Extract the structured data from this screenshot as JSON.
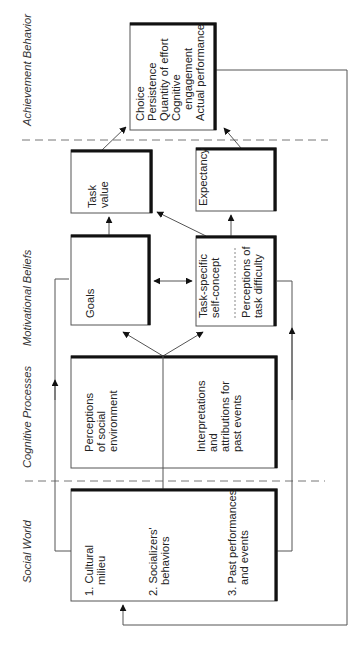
{
  "diagram": {
    "orientation": "rotated 90 degrees counter-clockwise",
    "stages": [
      {
        "id": "social_world",
        "label": "Social World"
      },
      {
        "id": "cognitive_processes",
        "label": "Cognitive Processes"
      },
      {
        "id": "motivational_beliefs",
        "label": "Motivational Beliefs"
      },
      {
        "id": "achievement_behavior",
        "label": "Achievement Behavior"
      }
    ],
    "boxes": {
      "achievement": {
        "lines": [
          "Choice",
          "Persistence",
          "Quantity of effort",
          "Cognitive",
          "engagement",
          "Actual performance"
        ]
      },
      "task_value": {
        "lines": [
          "Task",
          "value"
        ]
      },
      "expectancy": {
        "lines": [
          "Expectancy"
        ]
      },
      "goals": {
        "lines": [
          "Goals"
        ]
      },
      "self_concept": {
        "upper_lines": [
          "Task-specific",
          "self-concept"
        ],
        "lower_lines": [
          "Perceptions of",
          "task difficulty"
        ]
      },
      "cognitive": {
        "left_lines": [
          "Perceptions",
          "of social",
          "environment"
        ],
        "right_lines": [
          "Interpretations",
          "and",
          "attributions for",
          "past events"
        ]
      },
      "social": {
        "items": [
          {
            "lines": [
              "1. Cultural",
              "milieu"
            ]
          },
          {
            "lines": [
              "2. Socializers'",
              "behaviors"
            ]
          },
          {
            "lines": [
              "3. Past performances",
              "and events"
            ]
          }
        ]
      }
    },
    "connections": [
      {
        "from": "Task value",
        "to": "Achievement Behavior"
      },
      {
        "from": "Expectancy",
        "to": "Achievement Behavior"
      },
      {
        "from": "Goals",
        "to": "Task value"
      },
      {
        "from": "Task-specific self-concept",
        "to": "Task value"
      },
      {
        "from": "Task-specific self-concept",
        "to": "Expectancy"
      },
      {
        "from": "Goals",
        "to": "Task-specific self-concept",
        "bidirectional": true
      },
      {
        "from": "Cognitive Processes",
        "to": "Goals"
      },
      {
        "from": "Cognitive Processes",
        "to": "Task-specific self-concept"
      },
      {
        "from": "Social World",
        "to": "Cognitive Processes"
      },
      {
        "from": "Cultural milieu",
        "to": "Goals"
      },
      {
        "from": "Past performances and events",
        "to": "Task-specific self-concept"
      },
      {
        "from": "Achievement Behavior",
        "to": "Social World",
        "note": "feedback loop"
      }
    ],
    "colors": {
      "line": "#555555",
      "thick_border": "#111111",
      "dashed": "#777777",
      "text": "#222222"
    }
  }
}
